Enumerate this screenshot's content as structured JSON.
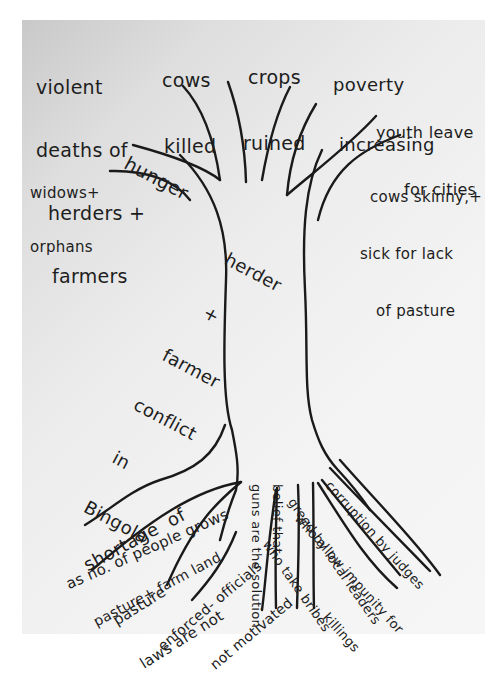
{
  "diagram": {
    "type": "problem tree",
    "colors": {
      "paper": "#eeeeee",
      "ink": "#1d1d1d",
      "background": "#ffffff"
    },
    "trunk": {
      "label_lines": [
        "herder",
        "+",
        "farmer",
        "conflict",
        "in",
        "Bingola"
      ]
    },
    "effects": {
      "violent_deaths": [
        "violent",
        "deaths of",
        "herders +",
        "farmers"
      ],
      "cows_killed": [
        "cows",
        "killed"
      ],
      "crops_ruined": [
        "crops",
        "ruined"
      ],
      "poverty": [
        "poverty",
        "increasing"
      ],
      "hunger": [
        "hunger"
      ],
      "youth": [
        "youth leave",
        "for cities"
      ],
      "widows": [
        "widows+",
        "orphans"
      ],
      "cows_skinny": [
        "cows skinny,+",
        "sick for lack",
        "of pasture"
      ]
    },
    "causes": {
      "shortage": [
        "shortage  of",
        "pasture+ farm land"
      ],
      "population": [
        "as no. of people grows"
      ],
      "pasture_laws": [
        "pasture",
        "laws are not"
      ],
      "enforced": [
        "enforced- officials",
        "not motivated"
      ],
      "guns": [
        "guns are the solution"
      ],
      "belief": [
        "belief that"
      ],
      "greed": [
        "greed by local leaders",
        "who take bribes"
      ],
      "corruption": [
        "corruption by judges",
        "who allow impunity for",
        "killings"
      ]
    }
  }
}
